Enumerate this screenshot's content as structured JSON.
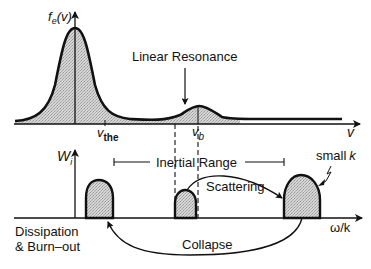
{
  "diagram": {
    "top_plot": {
      "y_axis_label": "f",
      "y_axis_label_sub": "e",
      "y_axis_label_arg": "(v)",
      "x_axis_label": "v",
      "tick_vthe": "v",
      "tick_vthe_sub": "the",
      "tick_vb": "v",
      "tick_vb_sub": "b",
      "annotation": "Linear Resonance"
    },
    "bottom_plot": {
      "y_axis_label": "W",
      "y_axis_label_sub": "i",
      "x_axis_label": "ω/k",
      "range_label": "Inertial Range",
      "small_k_label": "small",
      "small_k_var": "k",
      "scattering_label": "Scattering",
      "collapse_label": "Collapse",
      "dissipation_line1": "Dissipation",
      "dissipation_line2": "& Burn–out"
    },
    "colors": {
      "line": "#111111",
      "fill": "#c8c8c8",
      "background": "#ffffff"
    }
  }
}
